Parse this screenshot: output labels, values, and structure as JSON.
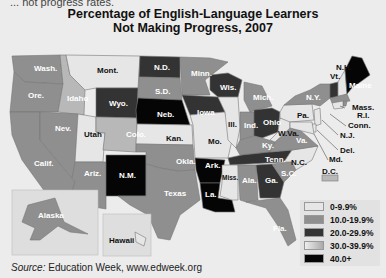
{
  "header": {
    "clipped_text": "... not progress rates.",
    "title_line1": "Percentage of English-Language Learners",
    "title_line2": "Not Making Progress, 2007"
  },
  "legend": {
    "items": [
      {
        "label": "0-9.9%",
        "color": "#e6e6e6"
      },
      {
        "label": "10.0-19.9%",
        "color": "#8f8f8f"
      },
      {
        "label": "20.0-29.9%",
        "color": "#333333"
      },
      {
        "label": "30.0-39.9%",
        "color": "#b8b8b8"
      },
      {
        "label": "40.0+",
        "color": "#050505"
      }
    ]
  },
  "states": [
    {
      "abbr": "Wash.",
      "category": "10.0-19.9%"
    },
    {
      "abbr": "Ore.",
      "category": "10.0-19.9%"
    },
    {
      "abbr": "Calif.",
      "category": "10.0-19.9%"
    },
    {
      "abbr": "Idaho",
      "category": "30.0-39.9%"
    },
    {
      "abbr": "Nev.",
      "category": "10.0-19.9%"
    },
    {
      "abbr": "Mont.",
      "category": "0-9.9%"
    },
    {
      "abbr": "Wyo.",
      "category": "20.0-29.9%"
    },
    {
      "abbr": "Utah",
      "category": "0-9.9%"
    },
    {
      "abbr": "Colo.",
      "category": "30.0-39.9%"
    },
    {
      "abbr": "Ariz.",
      "category": "10.0-19.9%"
    },
    {
      "abbr": "N.M.",
      "category": "40.0+"
    },
    {
      "abbr": "N.D.",
      "category": "20.0-29.9%"
    },
    {
      "abbr": "S.D.",
      "category": "10.0-19.9%"
    },
    {
      "abbr": "Neb.",
      "category": "40.0+"
    },
    {
      "abbr": "Kan.",
      "category": "0-9.9%"
    },
    {
      "abbr": "Okla.",
      "category": "10.0-19.9%"
    },
    {
      "abbr": "Texas",
      "category": "10.0-19.9%"
    },
    {
      "abbr": "Minn.",
      "category": "10.0-19.9%"
    },
    {
      "abbr": "Iowa",
      "category": "20.0-29.9%"
    },
    {
      "abbr": "Mo.",
      "category": "0-9.9%"
    },
    {
      "abbr": "Ark.",
      "category": "40.0+"
    },
    {
      "abbr": "La.",
      "category": "40.0+"
    },
    {
      "abbr": "Wis.",
      "category": "20.0-29.9%"
    },
    {
      "abbr": "Ill.",
      "category": "0-9.9%"
    },
    {
      "abbr": "Mich.",
      "category": "10.0-19.9%"
    },
    {
      "abbr": "Ind.",
      "category": "10.0-19.9%"
    },
    {
      "abbr": "Ohio",
      "category": "20.0-29.9%"
    },
    {
      "abbr": "Ky.",
      "category": "10.0-19.9%"
    },
    {
      "abbr": "Tenn.",
      "category": "20.0-29.9%"
    },
    {
      "abbr": "Miss.",
      "category": "0-9.9%"
    },
    {
      "abbr": "Ala.",
      "category": "10.0-19.9%"
    },
    {
      "abbr": "Ga.",
      "category": "20.0-29.9%"
    },
    {
      "abbr": "Fla.",
      "category": "10.0-19.9%"
    },
    {
      "abbr": "S.C.",
      "category": "10.0-19.9%"
    },
    {
      "abbr": "N.C.",
      "category": "0-9.9%"
    },
    {
      "abbr": "Va.",
      "category": "10.0-19.9%"
    },
    {
      "abbr": "W.Va.",
      "category": "0-9.9%"
    },
    {
      "abbr": "Pa.",
      "category": "0-9.9%"
    },
    {
      "abbr": "N.Y.",
      "category": "10.0-19.9%"
    },
    {
      "abbr": "Vt.",
      "category": "20.0-29.9%"
    },
    {
      "abbr": "N.H.",
      "category": "0-9.9%"
    },
    {
      "abbr": "Maine",
      "category": "40.0+"
    },
    {
      "abbr": "Mass.",
      "category": "10.0-19.9%"
    },
    {
      "abbr": "R.I.",
      "category": "10.0-19.9%"
    },
    {
      "abbr": "Conn.",
      "category": "0-9.9%"
    },
    {
      "abbr": "N.J.",
      "category": "0-9.9%"
    },
    {
      "abbr": "Del.",
      "category": "0-9.9%"
    },
    {
      "abbr": "Md.",
      "category": "0-9.9%"
    },
    {
      "abbr": "D.C.",
      "category": "30.0-39.9%"
    },
    {
      "abbr": "Alaska",
      "category": "10.0-19.9%"
    },
    {
      "abbr": "Hawaii",
      "category": "0-9.9%"
    }
  ],
  "labels": {
    "Wash.": "Wash.",
    "Ore.": "Ore.",
    "Calif.": "Calif.",
    "Idaho": "Idaho",
    "Nev.": "Nev.",
    "Mont.": "Mont.",
    "Wyo.": "Wyo.",
    "Utah": "Utah",
    "Colo.": "Colo.",
    "Ariz.": "Ariz.",
    "NM": "N.M.",
    "ND": "N.D.",
    "SD": "S.D.",
    "Neb.": "Neb.",
    "Kan.": "Kan.",
    "Okla.": "Okla.",
    "Texas": "Texas",
    "Minn.": "Minn.",
    "Iowa": "Iowa",
    "Mo.": "Mo.",
    "Ark.": "Ark.",
    "La.": "La.",
    "Wis.": "Wis.",
    "Ill.": "Ill.",
    "Mich.": "Mich.",
    "Ind.": "Ind.",
    "Ohio": "Ohio",
    "Ky.": "Ky.",
    "Tenn.": "Tenn.",
    "Miss.": "Miss.",
    "Ala.": "Ala.",
    "Ga.": "Ga.",
    "Fla.": "Fla.",
    "SC": "S.C.",
    "NC": "N.C.",
    "Va.": "Va.",
    "WVa": "W.Va.",
    "Pa.": "Pa.",
    "NY": "N.Y.",
    "Vt.": "Vt.",
    "NH": "N.H.",
    "Maine": "Maine",
    "Mass.": "Mass.",
    "RI": "R.I.",
    "Conn.": "Conn.",
    "NJ": "N.J.",
    "Del.": "Del.",
    "Md.": "Md.",
    "DC": "D.C.",
    "Alaska": "Alaska",
    "Hawaii": "Hawaii"
  },
  "footer": {
    "source_label": "Source:",
    "source_text": " Education Week, www.edweek.org"
  }
}
